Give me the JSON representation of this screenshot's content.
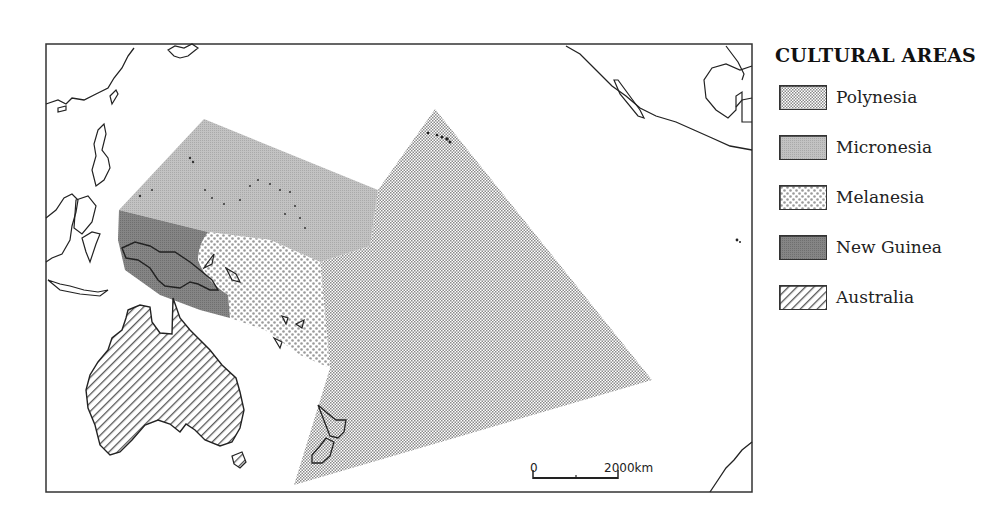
{
  "legend": {
    "title": "CULTURAL AREAS",
    "items": [
      {
        "label": "Polynesia",
        "pattern": "fine-dots",
        "color": "#bdbdbd"
      },
      {
        "label": "Micronesia",
        "pattern": "solid-light-gray",
        "color": "#b8b8b8"
      },
      {
        "label": "Melanesia",
        "pattern": "coarse-dots",
        "color": "#c8c8c8"
      },
      {
        "label": "New Guinea",
        "pattern": "solid-dark-gray",
        "color": "#7f7f7f"
      },
      {
        "label": "Australia",
        "pattern": "diagonal-hatch",
        "color": "#555555"
      }
    ]
  },
  "scale_bar": {
    "start_label": "0",
    "end_label": "2000km"
  },
  "regions": [
    {
      "name": "Polynesia"
    },
    {
      "name": "Micronesia"
    },
    {
      "name": "Melanesia"
    },
    {
      "name": "New Guinea"
    },
    {
      "name": "Australia"
    }
  ]
}
